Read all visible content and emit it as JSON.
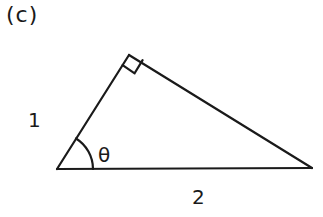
{
  "figure": {
    "panel_label": "(c)",
    "shape": "right-triangle",
    "vertices": {
      "bottom_left": [
        57,
        169
      ],
      "apex": [
        129,
        55
      ],
      "bottom_right": [
        312,
        168
      ]
    },
    "labels": {
      "hypotenuse_side": "1",
      "base": "2",
      "angle": "θ"
    },
    "right_angle_marker_at": "apex",
    "line_color": "#1a1a1a"
  }
}
